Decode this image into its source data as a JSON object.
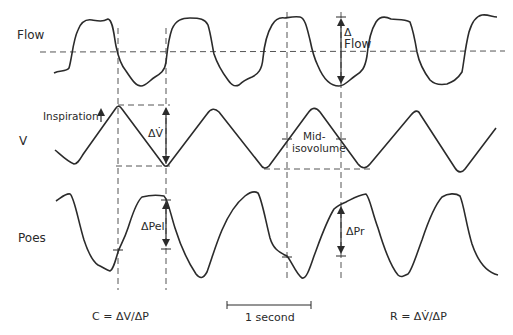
{
  "figure": {
    "traces": [
      {
        "id": "flow",
        "label": "Flow"
      },
      {
        "id": "volume",
        "label": "V"
      },
      {
        "id": "poes",
        "label": "Poes"
      }
    ],
    "annotations": {
      "delta_flow_symbol": "Δ",
      "delta_flow_word": "Flow",
      "inspiration": "Inspiration",
      "inspiration_arrow": "↑",
      "delta_v_dot": "ΔV̇",
      "mid_isovolume_line1": "Mid-",
      "mid_isovolume_line2": "isovolume",
      "delta_pel": "ΔPel",
      "delta_pr": "ΔPr"
    },
    "scale_bar": {
      "label": "1 second"
    },
    "formulas": {
      "compliance": "C = ΔV/ΔP",
      "resistance": "R = ΔV̇/ΔP"
    },
    "colors": {
      "line": "#2b2b2b",
      "dash": "#555555",
      "background": "#ffffff"
    }
  }
}
